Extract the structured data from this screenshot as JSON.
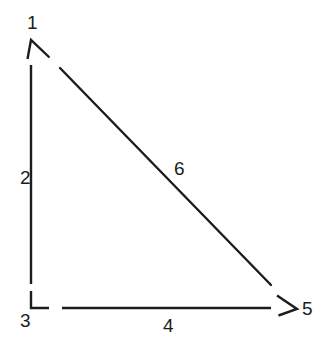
{
  "figure": {
    "kind": "line-drawing",
    "background_color": "#ffffff",
    "stroke_color": "#1c1c1c",
    "stroke_width": 2.4
  },
  "labels": {
    "apex_vertex": "1",
    "vertical_side": "2",
    "bottom_left_vertex": "3",
    "bottom_side": "4",
    "bottom_right_vertex": "5",
    "hypotenuse": "6"
  },
  "label_positions": {
    "apex_vertex": {
      "x": 27,
      "y": 13
    },
    "vertical_side": {
      "x": 20,
      "y": 168
    },
    "bottom_left_vertex": {
      "x": 20,
      "y": 311
    },
    "bottom_side": {
      "x": 163,
      "y": 316
    },
    "bottom_right_vertex": {
      "x": 302,
      "y": 299
    },
    "hypotenuse": {
      "x": 174,
      "y": 159
    }
  },
  "geometry": {
    "vertical_side_line": {
      "x1": 31,
      "y1": 65,
      "x2": 31,
      "y2": 284
    },
    "bottom_side_line": {
      "x1": 62,
      "y1": 308,
      "x2": 271,
      "y2": 308
    },
    "hypotenuse_line": {
      "x1": 60,
      "y1": 68,
      "x2": 271,
      "y2": 285
    },
    "apex_arrowhead": {
      "tip_x": 31,
      "tip_y": 40,
      "left_x": 27,
      "left_y": 58,
      "right_x": 49,
      "right_y": 57
    },
    "right_angle_marker": {
      "corner_x": 31,
      "corner_y": 308,
      "up_y": 291,
      "right_x": 49
    },
    "bottom_right_arrowhead": {
      "tip_x": 297,
      "tip_y": 309,
      "upper_x": 277,
      "upper_y": 295,
      "lower_x": 278,
      "lower_y": 315
    }
  },
  "icons": {
    "apex": "arrowhead-up-icon",
    "bottom_right": "arrowhead-right-icon",
    "bottom_left": "right-angle-marker-icon"
  }
}
